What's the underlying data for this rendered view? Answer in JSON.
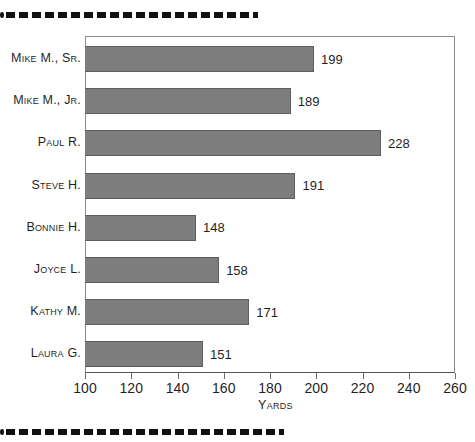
{
  "decor": {
    "top_rule": "dashed-rule",
    "bottom_rule": "dashed-rule"
  },
  "chart_data": {
    "type": "bar",
    "orientation": "horizontal",
    "title": "",
    "xlabel": "Yards",
    "ylabel": "",
    "xlim": [
      100,
      260
    ],
    "xticks": [
      100,
      120,
      140,
      160,
      180,
      200,
      220,
      240,
      260
    ],
    "grid": false,
    "legend": null,
    "bar_color": "#7d7d7d",
    "bar_border_color": "#5e5e5e",
    "categories": [
      "Mike M., Sr.",
      "Mike M., Jr.",
      "Paul R.",
      "Steve H.",
      "Bonnie H.",
      "Joyce L.",
      "Kathy M.",
      "Laura G."
    ],
    "values": [
      199,
      189,
      228,
      191,
      148,
      158,
      171,
      151
    ],
    "value_labels": [
      "199",
      "189",
      "228",
      "191",
      "148",
      "158",
      "171",
      "151"
    ],
    "tick_labels": [
      "100",
      "120",
      "140",
      "160",
      "180",
      "200",
      "220",
      "240",
      "260"
    ]
  }
}
